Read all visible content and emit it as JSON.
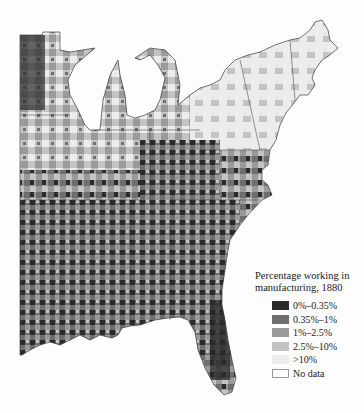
{
  "legend": {
    "title": "Percentage working in manufacturing, 1880",
    "items": [
      {
        "label": "0%–0.35%",
        "color": "#2a2a2a"
      },
      {
        "label": "0.35%–1%",
        "color": "#6e6e6e"
      },
      {
        "label": "1%–2.5%",
        "color": "#9a9a9a"
      },
      {
        "label": "2.5%–10%",
        "color": "#c4c4c4"
      },
      {
        "label": ">10%",
        "color": "#ececec"
      },
      {
        "label": "No data",
        "color": "#ffffff"
      }
    ]
  },
  "map": {
    "region": "Eastern United States, county-level",
    "labels": [
      "ME"
    ]
  }
}
